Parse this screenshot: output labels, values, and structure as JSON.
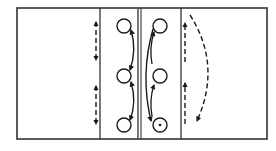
{
  "diagram": {
    "type": "court-drill-diagram",
    "stroke_color": "#1a1a1a",
    "background_color": "#ffffff",
    "court": {
      "x": 17,
      "y": 8,
      "width": 250,
      "height": 131
    },
    "lanes": {
      "left_line_x": 100,
      "center_line_x1": 138,
      "center_line_x2": 141,
      "right_line_x": 181
    },
    "players_left_column": [
      {
        "cx": 124,
        "cy": 26,
        "marked": false
      },
      {
        "cx": 124,
        "cy": 76,
        "marked": false
      },
      {
        "cx": 124,
        "cy": 125,
        "marked": false
      }
    ],
    "players_right_column": [
      {
        "cx": 160,
        "cy": 26,
        "marked": false
      },
      {
        "cx": 160,
        "cy": 76,
        "marked": false
      },
      {
        "cx": 160,
        "cy": 125,
        "marked": true
      }
    ],
    "movements": {
      "left_dashed": "two double-headed dashed vertical arrows along left lane line",
      "left_solid": "curved solid double-headed arrows between adjacent circles",
      "right_solid": "curved solid arrows: long arc from top to bottom circle, short arcs upward",
      "right_dashed": "two upward dashed arrows along right lane line and a curved dashed arrow sweeping down"
    }
  }
}
